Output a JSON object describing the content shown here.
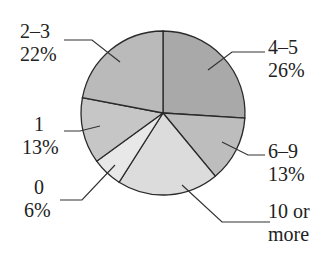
{
  "chart_data": {
    "type": "pie",
    "title": "",
    "start_angle_deg": 90,
    "direction": "clockwise",
    "slices": [
      {
        "label": "4–5",
        "value": 26,
        "value_label": "26%",
        "fill": "#a9a9a9"
      },
      {
        "label": "6–9",
        "value": 13,
        "value_label": "13%",
        "fill": "#bdbdbd"
      },
      {
        "label": "10 or more",
        "value": 20,
        "value_label": "",
        "fill": "#dcdcdc"
      },
      {
        "label": "0",
        "value": 6,
        "value_label": "6%",
        "fill": "#e8e8e8"
      },
      {
        "label": "1",
        "value": 13,
        "value_label": "13%",
        "fill": "#c6c6c6"
      },
      {
        "label": "2–3",
        "value": 22,
        "value_label": "22%",
        "fill": "#bababa"
      }
    ]
  },
  "labels": {
    "s45": {
      "line1": "4–5",
      "line2": "26%"
    },
    "s69": {
      "line1": "6–9",
      "line2": "13%"
    },
    "s10": {
      "line1": "10 or",
      "line2": "more"
    },
    "s0": {
      "line1": "0",
      "line2": "6%"
    },
    "s1": {
      "line1": "1",
      "line2": "13%"
    },
    "s23": {
      "line1": "2–3",
      "line2": "22%"
    }
  }
}
